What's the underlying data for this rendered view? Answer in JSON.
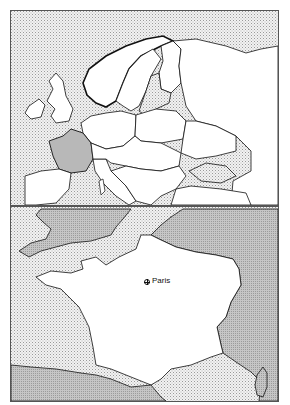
{
  "maps": {
    "overview": {
      "region": "Europe",
      "highlighted_country": "France",
      "highlight_color": "#b8b8b8",
      "land_color": "#ffffff",
      "sea_style": "stippled",
      "sea_color": "#e8e8e8"
    },
    "detail": {
      "region": "France",
      "focus_country_color": "#ffffff",
      "neighbor_land_color": "#bdbdbd",
      "sea_style": "stippled",
      "sea_color": "#e8e8e8",
      "cities": [
        {
          "name": "Paris",
          "marker": "city-marker-icon"
        }
      ]
    }
  }
}
